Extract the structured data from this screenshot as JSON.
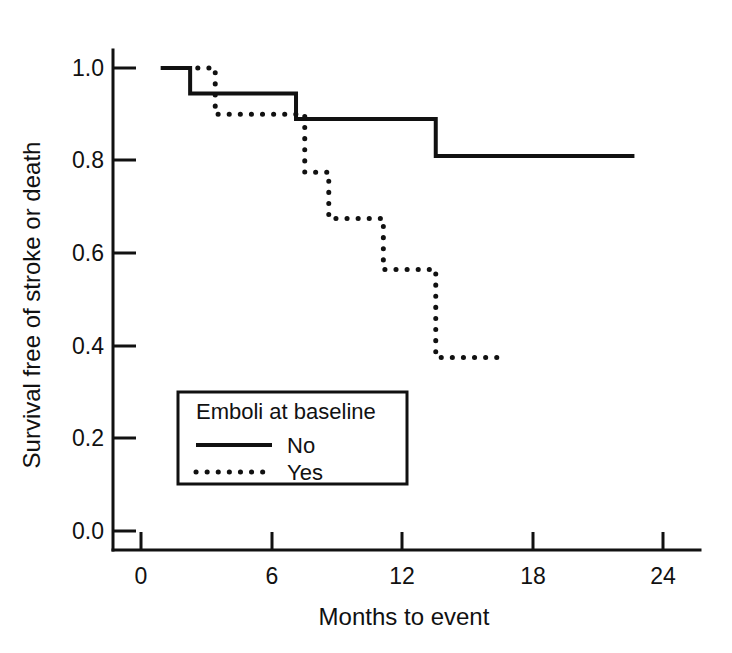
{
  "chart_data": {
    "type": "line",
    "title": "",
    "xlabel": "Months to event",
    "ylabel": "Survival free of stroke or death",
    "xlim": [
      -0.6,
      25.4
    ],
    "ylim": [
      -0.04,
      1.05
    ],
    "xticks": [
      0,
      6,
      12,
      18,
      24
    ],
    "xtick_labels": [
      "0",
      "6",
      "12",
      "18",
      "24"
    ],
    "yticks": [
      0.0,
      0.2,
      0.4,
      0.6,
      0.8,
      1.0
    ],
    "ytick_labels": [
      "0.0",
      "0.2",
      "0.4",
      "0.6",
      "0.8",
      "1.0"
    ],
    "grid": false,
    "legend_position": "lower-left-inside",
    "legend_title": "Emboli at baseline",
    "series": [
      {
        "name": "No",
        "style": "solid",
        "color": "#111111",
        "steps": [
          {
            "x": 0.9,
            "y": 1.0
          },
          {
            "x": 2.25,
            "y": 1.0
          },
          {
            "x": 2.25,
            "y": 0.945
          },
          {
            "x": 7.1,
            "y": 0.945
          },
          {
            "x": 7.1,
            "y": 0.89
          },
          {
            "x": 13.5,
            "y": 0.89
          },
          {
            "x": 13.5,
            "y": 0.81
          },
          {
            "x": 22.6,
            "y": 0.81
          }
        ]
      },
      {
        "name": "Yes",
        "style": "dotted",
        "color": "#111111",
        "steps": [
          {
            "x": 2.6,
            "y": 1.0
          },
          {
            "x": 3.4,
            "y": 1.0
          },
          {
            "x": 3.4,
            "y": 0.9
          },
          {
            "x": 7.5,
            "y": 0.9
          },
          {
            "x": 7.5,
            "y": 0.775
          },
          {
            "x": 8.6,
            "y": 0.775
          },
          {
            "x": 8.6,
            "y": 0.675
          },
          {
            "x": 11.1,
            "y": 0.675
          },
          {
            "x": 11.1,
            "y": 0.565
          },
          {
            "x": 13.5,
            "y": 0.565
          },
          {
            "x": 13.5,
            "y": 0.375
          },
          {
            "x": 16.3,
            "y": 0.375
          }
        ]
      }
    ]
  },
  "legend": {
    "title": "Emboli at baseline",
    "entries": [
      {
        "label": "No",
        "style": "solid"
      },
      {
        "label": "Yes",
        "style": "dotted"
      }
    ]
  },
  "axes": {
    "x_title": "Months to event",
    "y_title": "Survival free of stroke or death"
  }
}
